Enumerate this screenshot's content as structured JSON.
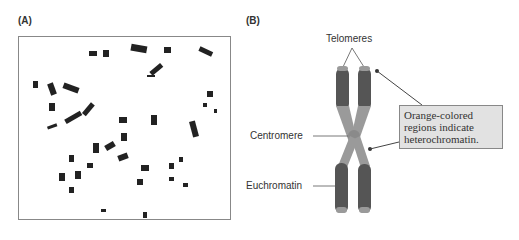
{
  "panels": {
    "a": {
      "label": "(A)",
      "description": "micrograph of chromosome spread"
    },
    "b": {
      "label": "(B)",
      "description": "chromosome diagram"
    }
  },
  "diagram": {
    "labels": {
      "telomeres": "Telomeres",
      "centromere": "Centromere",
      "euchromatin": "Euchromatin"
    },
    "callout": {
      "line1": "Orange-colored",
      "line2": "regions indicate",
      "line3": "heterochromatin."
    },
    "colors": {
      "euchromatin": "#555555",
      "heterochromatin": "#9a9a9a",
      "callout_bg": "#e2e2e2"
    }
  }
}
